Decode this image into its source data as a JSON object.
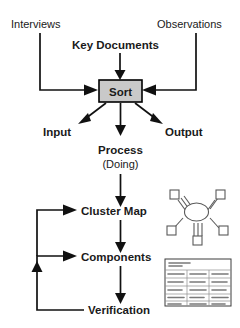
{
  "diagram": {
    "nodes": {
      "interviews": "Interviews",
      "observations": "Observations",
      "key_documents": "Key Documents",
      "sort": "Sort",
      "input": "Input",
      "output": "Output",
      "process": "Process",
      "process_sub": "(Doing)",
      "cluster_map": "Cluster Map",
      "components": "Components",
      "verification": "Verification"
    },
    "icons": {
      "cluster_map_thumb": "cluster-map-icon",
      "document_thumb": "document-table-icon",
      "arrow": "arrowhead-icon"
    },
    "colors": {
      "sort_fill": "#c9c9c9",
      "line": "#111111",
      "text": "#1a1a1a",
      "background": "#ffffff",
      "icon_stroke": "#5a5a5a"
    }
  }
}
